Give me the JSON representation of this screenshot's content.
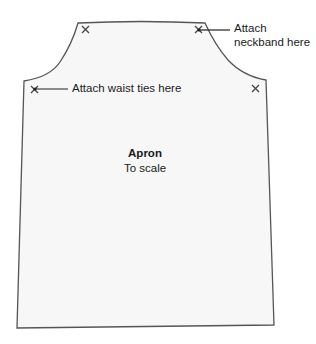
{
  "diagram": {
    "title": "Apron",
    "subtitle": "To scale",
    "labels": {
      "neckband_line1": "Attach",
      "neckband_line2": "neckband here",
      "waist": "Attach waist ties here"
    },
    "markers": [
      "x-mark",
      "x-mark",
      "x-mark",
      "x-mark"
    ],
    "colors": {
      "outline": "#555555",
      "fill": "#f7f7f7",
      "text": "#1a1a1a"
    }
  }
}
